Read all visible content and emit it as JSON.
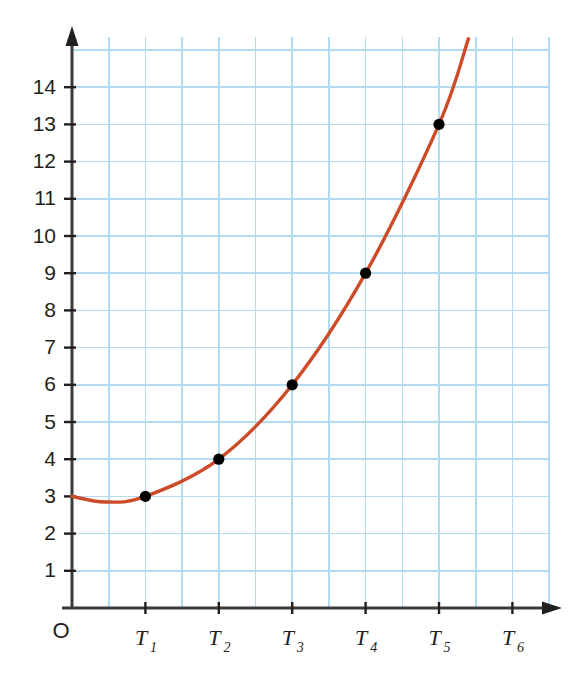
{
  "chart_data": {
    "type": "line",
    "title": "",
    "subtitle": "",
    "xlabel": "",
    "ylabel": "",
    "grid": true,
    "legend": false,
    "curve_color": "#cc4b28",
    "grid_color": "#b3dcf2",
    "axis_color": "#3b3b3b",
    "point_color": "#000000",
    "origin_label": "O",
    "x_categories": [
      "T1",
      "T2",
      "T3",
      "T4",
      "T5",
      "T6"
    ],
    "x_tick_labels": [
      {
        "letter": "T",
        "sub": "1"
      },
      {
        "letter": "T",
        "sub": "2"
      },
      {
        "letter": "T",
        "sub": "3"
      },
      {
        "letter": "T",
        "sub": "4"
      },
      {
        "letter": "T",
        "sub": "5"
      },
      {
        "letter": "T",
        "sub": "6"
      }
    ],
    "y_tick_labels": [
      "1",
      "2",
      "3",
      "4",
      "5",
      "6",
      "7",
      "8",
      "9",
      "10",
      "11",
      "12",
      "13",
      "14"
    ],
    "y_tick_values": [
      1,
      2,
      3,
      4,
      5,
      6,
      7,
      8,
      9,
      10,
      11,
      12,
      13,
      14
    ],
    "ylim": [
      0,
      15.3
    ],
    "xlim": [
      0,
      6.5
    ],
    "points": [
      {
        "x_label": "T1",
        "x": 1,
        "y": 3
      },
      {
        "x_label": "T2",
        "x": 2,
        "y": 4
      },
      {
        "x_label": "T3",
        "x": 3,
        "y": 6
      },
      {
        "x_label": "T4",
        "x": 4,
        "y": 9
      },
      {
        "x_label": "T5",
        "x": 5,
        "y": 13
      }
    ],
    "curve_description": "Smooth upward-curving line starting at y=3 on the vertical axis, dipping slightly to about 2.85, then rising through each marked point and leaving the top of the grid.",
    "curve_start": {
      "x": 0,
      "y": 3
    },
    "curve_min": {
      "x": 0.45,
      "y": 2.85
    },
    "curve_end": {
      "x": 5.4,
      "y": 15.3
    }
  }
}
